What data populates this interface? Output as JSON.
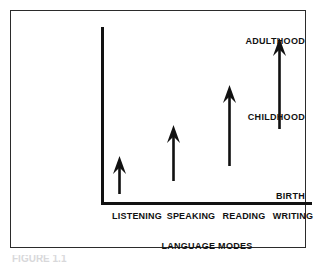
{
  "figure": {
    "caption_sliver": "FIGURE 1.1",
    "axis_title": "LANGUAGE MODES",
    "y_labels": {
      "top": "ADULTHOOD",
      "middle": "CHILDHOOD",
      "bottom": "BIRTH"
    }
  },
  "chart_data": {
    "type": "bar",
    "title": "",
    "subtitle": "",
    "xlabel": "LANGUAGE MODES",
    "ylabel": "",
    "grid": false,
    "legend": "none",
    "categories": [
      "LISTENING",
      "SPEAKING",
      "READING",
      "WRITING"
    ],
    "y_tick_labels": [
      "BIRTH",
      "CHILDHOOD",
      "ADULTHOOD"
    ],
    "y_tick_values": [
      0,
      50,
      100
    ],
    "ylim": [
      0,
      115
    ],
    "series": [
      {
        "name": "Age span of language mode development",
        "start_values": [
          0,
          8,
          18,
          43
        ],
        "end_values": [
          25,
          45,
          70,
          102
        ],
        "marker": "upward-arrow"
      }
    ],
    "annotations": [
      "Each arrow begins at the age the language mode typically emerges and points upward to show continued development.",
      "LISTENING begins at BIRTH; SPEAKING, READING and WRITING begin progressively later.",
      "Later-starting modes are drawn with longer arrows reaching toward ADULTHOOD."
    ]
  },
  "arrows": [
    {
      "name": "listening-arrow",
      "x": 118,
      "base_y": 193,
      "tip_y": 155
    },
    {
      "name": "speaking-arrow",
      "x": 172,
      "base_y": 180,
      "tip_y": 124
    },
    {
      "name": "reading-arrow",
      "x": 228,
      "base_y": 165,
      "tip_y": 84
    },
    {
      "name": "writing-arrow",
      "x": 278,
      "base_y": 128,
      "tip_y": 37
    }
  ],
  "x_label_positions": [
    126,
    180,
    233,
    282
  ]
}
